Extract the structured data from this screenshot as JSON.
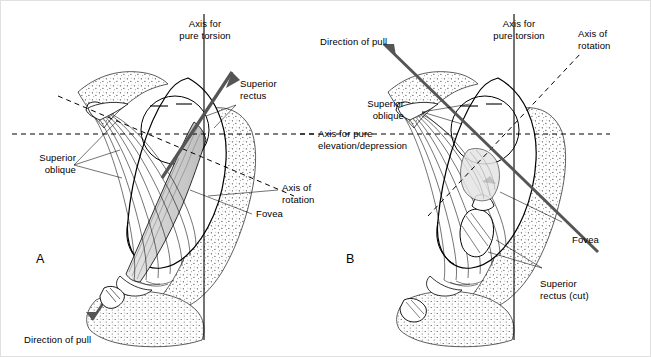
{
  "figure": {
    "panels": [
      {
        "id": "A",
        "letter": "A",
        "labels": {
          "axis_pure_torsion": "Axis for\npure torsion",
          "superior_rectus": "Superior\nrectus",
          "superior_oblique": "Superior\noblique",
          "axis_of_rotation": "Axis of\nrotation",
          "fovea": "Fovea",
          "direction_of_pull": "Direction of pull"
        }
      },
      {
        "id": "B",
        "letter": "B",
        "labels": {
          "direction_of_pull": "Direction of pull",
          "axis_pure_torsion": "Axis for\npure torsion",
          "axis_of_rotation": "Axis of\nrotation",
          "superior_oblique": "Superior\noblique",
          "fovea": "Fovea",
          "superior_rectus_cut": "Superior\nrectus (cut)"
        }
      }
    ],
    "shared_labels": {
      "axis_pure_elevation": "Axis for pure\nelevation/depression"
    },
    "colors": {
      "ink": "#000000",
      "background": "#ffffff",
      "stipple": "#555555",
      "muscle_fill": "#d8d8d8"
    }
  }
}
